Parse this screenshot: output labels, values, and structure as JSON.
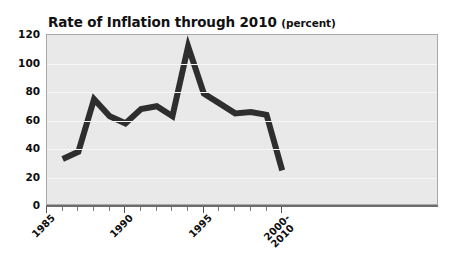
{
  "chart_data": {
    "type": "line",
    "title": "Rate of Inflation through 2010",
    "title_unit": "(percent)",
    "xlabel": "",
    "ylabel": "",
    "ylim": [
      0,
      120
    ],
    "xlim": [
      1985,
      2010
    ],
    "grid": true,
    "legend": false,
    "line_color": "#2e2e2e",
    "plot_background": "#e9e9e9",
    "gridline_color": "#f6f6f6",
    "y_ticks": [
      0,
      20,
      40,
      60,
      80,
      100,
      120
    ],
    "x_tick_values": [
      1985,
      1986,
      1987,
      1988,
      1989,
      1990,
      1991,
      1992,
      1993,
      1994,
      1995,
      1996,
      1997,
      1998,
      1999,
      2000
    ],
    "x_tick_labels": [
      {
        "value": 1985,
        "line1": "1985",
        "line2": ""
      },
      {
        "value": 1990,
        "line1": "1990",
        "line2": ""
      },
      {
        "value": 1995,
        "line1": "1995",
        "line2": ""
      },
      {
        "value": 2000,
        "line1": "2000-",
        "line2": "2010"
      }
    ],
    "x": [
      1986,
      1987,
      1988,
      1989,
      1990,
      1991,
      1992,
      1993,
      1994,
      1995,
      1996,
      1997,
      1998,
      1999,
      2000
    ],
    "values": [
      33,
      38,
      75,
      63,
      58,
      68,
      70,
      63,
      112,
      79,
      72,
      65,
      66,
      64,
      25
    ],
    "series": [
      {
        "name": "Rate of Inflation",
        "values": [
          33,
          38,
          75,
          63,
          58,
          68,
          70,
          63,
          112,
          79,
          72,
          65,
          66,
          64,
          25
        ]
      }
    ]
  }
}
